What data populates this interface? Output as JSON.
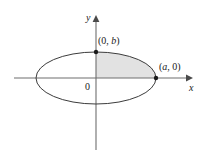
{
  "figure": {
    "axes": {
      "x_label": "x",
      "y_label": "y",
      "origin_label": "0",
      "x_axis_y": 78,
      "y_axis_x": 96,
      "x_start": 14,
      "x_end": 192,
      "y_start": 16,
      "y_end": 150
    },
    "ellipse": {
      "center_x": 96,
      "center_y": 78,
      "semi_major_a": 60,
      "semi_minor_b": 26,
      "stroke_color": "#3c3c3c",
      "fill_color": "#ffffff"
    },
    "shaded_region": {
      "quadrant": "first",
      "fill_color": "#e2e2e2"
    },
    "points": [
      {
        "name": "vertex-top",
        "label_open": "(0, ",
        "label_var": "b",
        "label_close": ")",
        "x": 96,
        "y": 52
      },
      {
        "name": "vertex-right",
        "label_open": "(",
        "label_var": "a",
        "label_close": ", 0)",
        "x": 156,
        "y": 78
      }
    ],
    "colors": {
      "background": "#ffffff",
      "axis": "#6e6e6e",
      "curve": "#3c3c3c",
      "shade": "#e2e2e2",
      "text": "#1a1a1a",
      "dot": "#1a1a1a"
    }
  }
}
